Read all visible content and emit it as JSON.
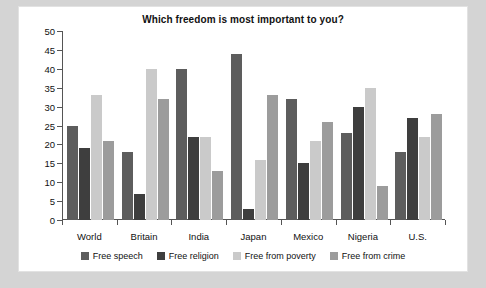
{
  "chart_data": {
    "type": "bar",
    "title": "Which freedom is most important to you?",
    "xlabel": "",
    "ylabel": "",
    "ylim": [
      0,
      50
    ],
    "yticks": [
      0,
      5,
      10,
      15,
      20,
      25,
      30,
      35,
      40,
      45,
      50
    ],
    "grid": false,
    "legend_position": "bottom",
    "categories": [
      "World",
      "Britain",
      "India",
      "Japan",
      "Mexico",
      "Nigeria",
      "U.S."
    ],
    "series": [
      {
        "name": "Free speech",
        "color": "#5d5d5d",
        "values": [
          25,
          18,
          40,
          44,
          32,
          23,
          18
        ]
      },
      {
        "name": "Free religion",
        "color": "#3e3e3e",
        "values": [
          19,
          7,
          22,
          3,
          15,
          30,
          27
        ]
      },
      {
        "name": "Free from poverty",
        "color": "#cacaca",
        "values": [
          33,
          40,
          22,
          16,
          21,
          35,
          22
        ]
      },
      {
        "name": "Free from crime",
        "color": "#9c9c9c",
        "values": [
          21,
          32,
          13,
          33,
          26,
          9,
          28
        ]
      }
    ]
  }
}
